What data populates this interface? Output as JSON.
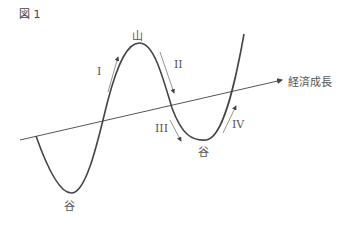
{
  "figure": {
    "label": "図 1",
    "axis_label": "経済成長",
    "peak_label": "山",
    "trough_label_left": "谷",
    "trough_label_right": "谷",
    "phases": [
      "I",
      "II",
      "III",
      "IV"
    ]
  },
  "colors": {
    "curve": "#444444",
    "trend": "#555555",
    "arrow": "#666666",
    "text": "#555555"
  }
}
